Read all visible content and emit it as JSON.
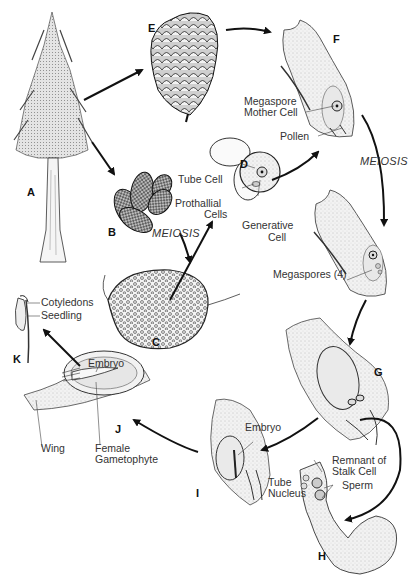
{
  "diagram": {
    "stage_letters": {
      "A": "A",
      "B": "B",
      "C": "C",
      "D": "D",
      "E": "E",
      "F": "F",
      "G": "G",
      "H": "H",
      "I": "I",
      "J": "J",
      "K": "K"
    },
    "process_labels": {
      "meiosis_male": "MEIOSIS",
      "meiosis_female": "MEIOSIS"
    },
    "labels": {
      "tube_cell": "Tube Cell",
      "prothallial_cells_1": "Prothallial",
      "prothallial_cells_2": "Cells",
      "generative_cell_1": "Generative",
      "generative_cell_2": "Cell",
      "megaspore_mother_cell_1": "Megaspore",
      "megaspore_mother_cell_2": "Mother Cell",
      "pollen": "Pollen",
      "megaspores": "Megaspores (4)",
      "remnant_stalk_1": "Remnant of",
      "remnant_stalk_2": "Stalk Cell",
      "sperm": "Sperm",
      "tube_nucleus_1": "Tube",
      "tube_nucleus_2": "Nucleus",
      "embryo_i": "Embryo",
      "embryo_j": "Embryo",
      "wing": "Wing",
      "female_gametophyte_1": "Female",
      "female_gametophyte_2": "Gametophyte",
      "cotyledons": "Cotyledons",
      "seedling": "Seedling"
    },
    "stages": [
      {
        "id": "A",
        "name": "Mature pine tree (sporophyte)"
      },
      {
        "id": "B",
        "name": "Pollen (male) cones"
      },
      {
        "id": "C",
        "name": "Microsporangium with microspores"
      },
      {
        "id": "D",
        "name": "Pollen grain"
      },
      {
        "id": "E",
        "name": "Ovulate (female) cone"
      },
      {
        "id": "F",
        "name": "Ovule with megaspore mother cell"
      },
      {
        "id": "G",
        "name": "Female gametophyte with archegonia"
      },
      {
        "id": "H",
        "name": "Pollen tube"
      },
      {
        "id": "I",
        "name": "Fertilized ovule with embryo"
      },
      {
        "id": "J",
        "name": "Seed"
      },
      {
        "id": "K",
        "name": "Seedling"
      }
    ],
    "colors": {
      "ink": "#1a1a1a",
      "stipple": "#9a9a9a",
      "fill_light": "#ededed",
      "background": "#ffffff"
    }
  }
}
